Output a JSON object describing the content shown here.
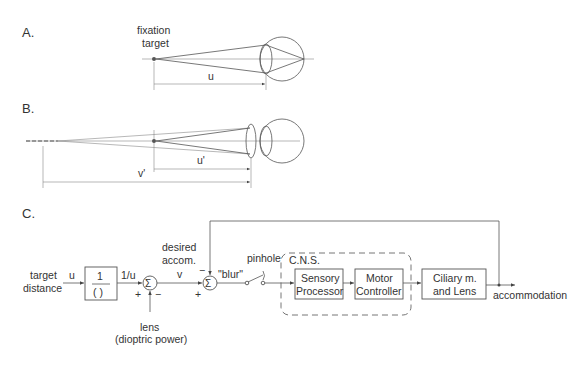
{
  "panels": {
    "a": {
      "label": "A.",
      "target_label_line1": "fixation",
      "target_label_line2": "target",
      "distance_label": "u"
    },
    "b": {
      "label": "B.",
      "distance_label_u": "u'",
      "distance_label_v": "v'"
    },
    "c": {
      "label": "C.",
      "input_label_line1": "target",
      "input_label_line2": "distance",
      "input_signal": "u",
      "reciprocal_block_num": "1",
      "reciprocal_block_den": "( )",
      "reciprocal_output": "1/u",
      "sum_symbol": "Σ",
      "sum1_plus": "+",
      "sum1_minus": "−",
      "lens_label_line1": "lens",
      "lens_label_line2": "(dioptric power)",
      "desired_label_line1": "desired",
      "desired_label_line2": "accom.",
      "desired_signal": "v",
      "sum2_plus": "+",
      "sum2_minus": "−",
      "blur_label": "\"blur\"",
      "pinhole_label": "pinhole",
      "cns_label": "C.N.S.",
      "sensory_line1": "Sensory",
      "sensory_line2": "Processor",
      "motor_line1": "Motor",
      "motor_line2": "Controller",
      "ciliary_line1": "Ciliary m.",
      "ciliary_line2": "and Lens",
      "output_label": "accommodation"
    }
  }
}
